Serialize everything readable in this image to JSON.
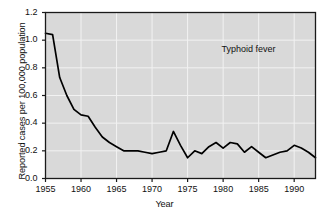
{
  "chart_data": {
    "type": "line",
    "title": "",
    "xlabel": "Year",
    "ylabel": "Reported cases per 100,000 population",
    "xlim": [
      1955,
      1993
    ],
    "ylim": [
      0.0,
      1.2
    ],
    "xticks": [
      1955,
      1960,
      1965,
      1970,
      1975,
      1980,
      1985,
      1990
    ],
    "yticks": [
      "0.0",
      "0.2",
      "0.4",
      "0.6",
      "0.8",
      "1.0",
      "1.2"
    ],
    "grid": true,
    "legend": "none",
    "annotations": [
      {
        "text": "Typhoid fever",
        "x": 1984,
        "y": 0.93
      }
    ],
    "series": [
      {
        "name": "Typhoid fever",
        "color": "#000000",
        "x": [
          1955,
          1956,
          1957,
          1958,
          1959,
          1960,
          1961,
          1962,
          1963,
          1964,
          1965,
          1966,
          1967,
          1968,
          1969,
          1970,
          1971,
          1972,
          1973,
          1974,
          1975,
          1976,
          1977,
          1978,
          1979,
          1980,
          1981,
          1982,
          1983,
          1984,
          1985,
          1986,
          1987,
          1988,
          1989,
          1990,
          1991,
          1992,
          1993
        ],
        "values": [
          1.05,
          1.04,
          0.73,
          0.6,
          0.5,
          0.46,
          0.45,
          0.37,
          0.3,
          0.26,
          0.23,
          0.2,
          0.2,
          0.2,
          0.19,
          0.18,
          0.19,
          0.2,
          0.34,
          0.24,
          0.15,
          0.2,
          0.18,
          0.23,
          0.26,
          0.22,
          0.26,
          0.25,
          0.19,
          0.23,
          0.19,
          0.15,
          0.17,
          0.19,
          0.2,
          0.24,
          0.22,
          0.19,
          0.15
        ]
      }
    ]
  },
  "plot": {
    "background_color": "#d9d9d9",
    "grid_color": "#f2f2f2",
    "frame_color": "#1a1a1a",
    "line_color": "#000000"
  }
}
